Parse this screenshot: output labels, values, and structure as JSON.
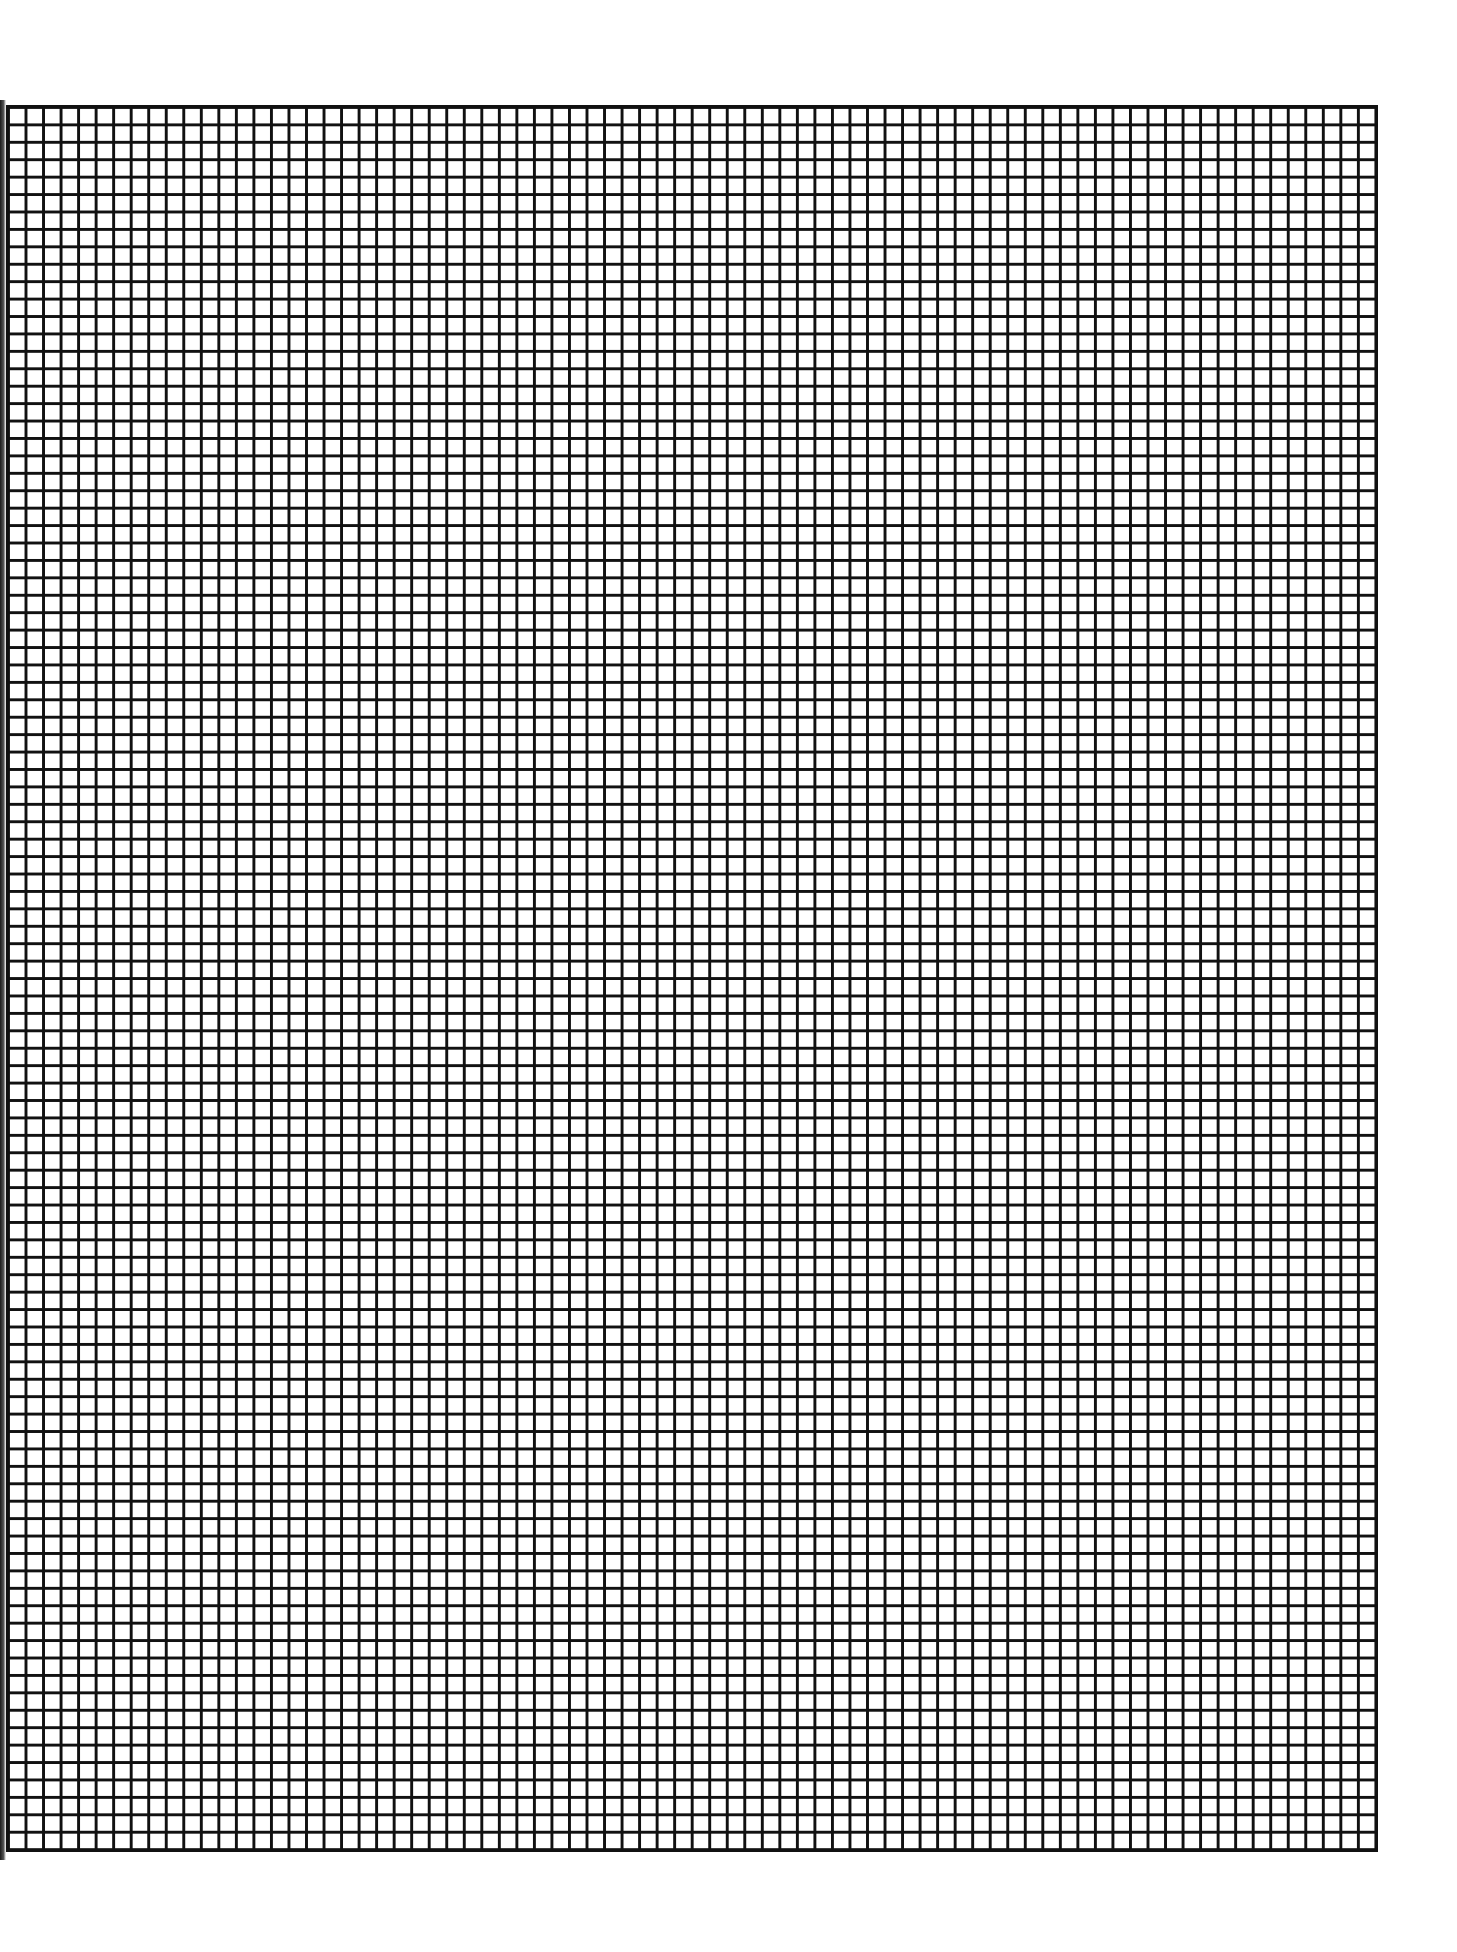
{
  "document": {
    "type": "graph-paper",
    "grid": {
      "columns": 78,
      "rows": 100,
      "line_color": "#111111",
      "background_color": "#ffffff"
    }
  }
}
